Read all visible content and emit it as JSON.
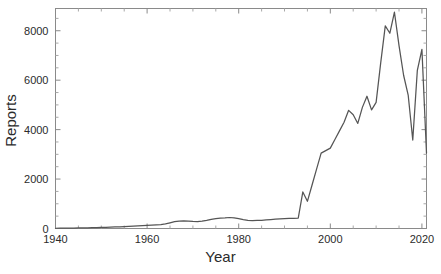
{
  "chart_data": {
    "type": "line",
    "title": "",
    "xlabel": "Year",
    "ylabel": "Reports",
    "xlim": [
      1940,
      2021
    ],
    "ylim": [
      0,
      8900
    ],
    "grid": false,
    "legend": null,
    "x_ticks": [
      1940,
      1960,
      1980,
      2000,
      2020
    ],
    "x_tick_labels": [
      "1940",
      "1960",
      "1980",
      "2000",
      "2020"
    ],
    "x_minor_tick_step": 5,
    "y_ticks": [
      0,
      2000,
      4000,
      6000,
      8000
    ],
    "y_tick_labels": [
      "0",
      "2000",
      "4000",
      "6000",
      "8000"
    ],
    "y_minor_tick_step": 500,
    "series": [
      {
        "name": "Reports",
        "color": "#555555",
        "x": [
          1940,
          1941,
          1942,
          1943,
          1944,
          1945,
          1946,
          1947,
          1948,
          1949,
          1950,
          1951,
          1952,
          1953,
          1954,
          1955,
          1956,
          1957,
          1958,
          1959,
          1960,
          1961,
          1962,
          1963,
          1964,
          1965,
          1966,
          1967,
          1968,
          1969,
          1970,
          1971,
          1972,
          1973,
          1974,
          1975,
          1976,
          1977,
          1978,
          1979,
          1980,
          1981,
          1982,
          1983,
          1984,
          1985,
          1986,
          1987,
          1988,
          1989,
          1990,
          1991,
          1992,
          1993,
          1994,
          1995,
          1996,
          1997,
          1998,
          1999,
          2000,
          2001,
          2002,
          2003,
          2004,
          2005,
          2006,
          2007,
          2008,
          2009,
          2010,
          2011,
          2012,
          2013,
          2014,
          2015,
          2016,
          2017,
          2018,
          2019,
          2020,
          2021
        ],
        "values": [
          10,
          12,
          14,
          16,
          18,
          22,
          26,
          30,
          34,
          38,
          44,
          50,
          56,
          62,
          70,
          78,
          86,
          95,
          105,
          115,
          125,
          135,
          148,
          160,
          185,
          230,
          275,
          300,
          310,
          300,
          285,
          280,
          300,
          330,
          370,
          400,
          420,
          430,
          445,
          430,
          400,
          360,
          330,
          320,
          325,
          330,
          345,
          360,
          375,
          390,
          400,
          405,
          410,
          420,
          1480,
          1100,
          1750,
          2400,
          3050,
          3150,
          3250,
          3600,
          3950,
          4300,
          4780,
          4600,
          4250,
          4900,
          5350,
          4800,
          5100,
          6700,
          8200,
          7900,
          8750,
          7400,
          6200,
          5400,
          3580,
          6400,
          7250,
          3050
        ]
      }
    ]
  },
  "axis_labels": {
    "x_title": "Year",
    "y_title": "Reports"
  },
  "colors": {
    "line": "#555555",
    "frame": "#8a8a8a",
    "text": "#2b2b2b",
    "background": "#ffffff"
  }
}
